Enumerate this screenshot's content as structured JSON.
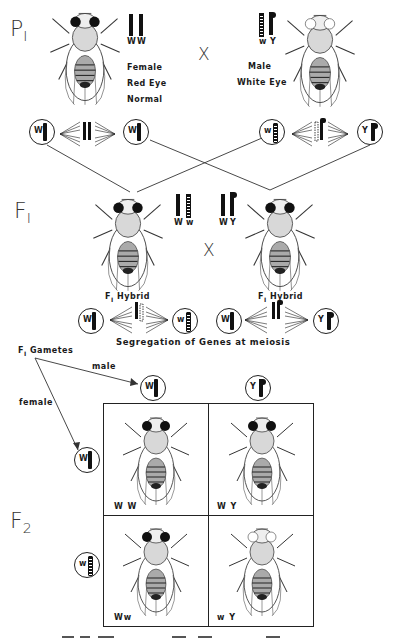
{
  "diagram": {
    "type": "genetic cross diagram (sex-linked inheritance, Drosophila eye color)",
    "generations": {
      "p1": {
        "label": "P",
        "sub": "I"
      },
      "f1": {
        "label": "F",
        "sub": "I"
      },
      "f2": {
        "label": "F",
        "sub": "2"
      }
    },
    "cross_symbol": "X",
    "parents": {
      "female": {
        "genotype_labels": [
          "W",
          "W"
        ],
        "description": [
          "Female",
          "Red Eye",
          "Normal"
        ]
      },
      "male": {
        "genotype_labels": [
          "w",
          "Y"
        ],
        "description": [
          "Male",
          "White Eye"
        ]
      }
    },
    "p1_gametes": [
      {
        "allele": "W",
        "chromosome": "X-normal"
      },
      {
        "allele": "W",
        "chromosome": "X-normal"
      },
      {
        "allele": "w",
        "chromosome": "X-white"
      },
      {
        "allele": "Y",
        "chromosome": "Y"
      }
    ],
    "f1": {
      "female": {
        "genotype_labels": [
          "W",
          "w"
        ],
        "label": "F",
        "label_sub": "I",
        "label_rest": "Hybrid"
      },
      "male": {
        "genotype_labels": [
          "W",
          "Y"
        ],
        "label": "F",
        "label_sub": "I",
        "label_rest": "Hybrid"
      },
      "segregation_caption": "Segregation of Genes at meiosis",
      "gametes": [
        {
          "allele": "W"
        },
        {
          "allele": "w"
        },
        {
          "allele": "W"
        },
        {
          "allele": "Y"
        }
      ]
    },
    "f1_gametes_section": {
      "title": "F",
      "title_sub": "I",
      "title_rest": "Gametes",
      "male_label": "male",
      "female_label": "female",
      "male_gametes": [
        {
          "allele": "W"
        },
        {
          "allele": "Y"
        }
      ],
      "female_gametes": [
        {
          "allele": "W"
        },
        {
          "allele": "w"
        }
      ]
    },
    "punnett": {
      "cells": [
        {
          "row": 0,
          "col": 0,
          "genotype": "W W",
          "phenotype": "red-eyed female"
        },
        {
          "row": 0,
          "col": 1,
          "genotype": "W Y",
          "phenotype": "red-eyed male"
        },
        {
          "row": 1,
          "col": 0,
          "genotype": "Ww",
          "phenotype": "red-eyed female"
        },
        {
          "row": 1,
          "col": 1,
          "genotype": "w Y",
          "phenotype": "white-eyed male"
        }
      ]
    }
  }
}
